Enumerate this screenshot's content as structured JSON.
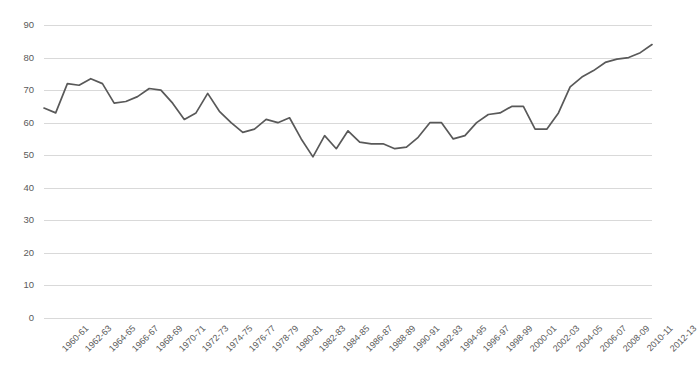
{
  "chart_data": {
    "type": "line",
    "title": "",
    "subtitle": "",
    "xlabel": "",
    "ylabel": "",
    "ylim": [
      0,
      90
    ],
    "y_ticks": [
      0,
      10,
      20,
      30,
      40,
      50,
      60,
      70,
      80,
      90
    ],
    "grid": true,
    "legend": "none",
    "line_color": "#595959",
    "x_tick_labels": [
      "1960-61",
      "1962-63",
      "1964-65",
      "1966-67",
      "1968-69",
      "1970-71",
      "1972-73",
      "1974-75",
      "1976-77",
      "1978-79",
      "1980-81",
      "1982-83",
      "1984-85",
      "1986-87",
      "1988-89",
      "1990-91",
      "1992-93",
      "1994-95",
      "1996-97",
      "1998-99",
      "2000-01",
      "2002-03",
      "2004-05",
      "2006-07",
      "2008-09",
      "2010-11",
      "2012-13"
    ],
    "x_tick_interval_years": 2,
    "x": [
      "1960-61",
      "1961-62",
      "1962-63",
      "1963-64",
      "1964-65",
      "1965-66",
      "1966-67",
      "1967-68",
      "1968-69",
      "1969-70",
      "1970-71",
      "1971-72",
      "1972-73",
      "1973-74",
      "1974-75",
      "1975-76",
      "1976-77",
      "1977-78",
      "1978-79",
      "1979-80",
      "1980-81",
      "1981-82",
      "1982-83",
      "1983-84",
      "1984-85",
      "1985-86",
      "1986-87",
      "1987-88",
      "1988-89",
      "1989-90",
      "1990-91",
      "1991-92",
      "1992-93",
      "1993-94",
      "1994-95",
      "1995-96",
      "1996-97",
      "1997-98",
      "1998-99",
      "1999-00",
      "2000-01",
      "2001-02",
      "2002-03",
      "2003-04",
      "2004-05",
      "2005-06",
      "2006-07",
      "2007-08",
      "2008-09",
      "2009-10",
      "2010-11",
      "2011-12",
      "2012-13"
    ],
    "values": [
      64.5,
      63.0,
      72.0,
      71.5,
      73.5,
      72.0,
      66.0,
      66.5,
      68.0,
      70.5,
      70.0,
      66.0,
      61.0,
      63.0,
      69.0,
      63.5,
      60.0,
      57.0,
      58.0,
      61.0,
      60.0,
      61.5,
      55.0,
      49.5,
      56.0,
      52.0,
      57.5,
      54.0,
      53.5,
      53.5,
      52.0,
      52.5,
      55.5,
      60.0,
      60.0,
      55.0,
      56.0,
      60.0,
      62.5,
      63.0,
      65.0,
      65.0,
      58.0,
      58.0,
      63.0,
      71.0,
      74.0,
      76.0,
      78.5,
      79.5,
      80.0,
      81.5,
      84.0
    ]
  }
}
